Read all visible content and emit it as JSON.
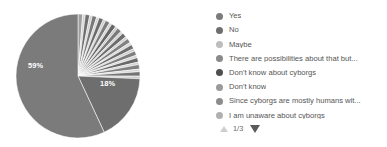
{
  "widget": {
    "type": "pie-chart-with-legend",
    "background": "#ffffff"
  },
  "chart_data": {
    "type": "pie",
    "title": "",
    "legend_position": "right",
    "grid": false,
    "labels_shown_on_slices": [
      "59%",
      "18%"
    ],
    "categories": [
      "Yes",
      "No",
      "Maybe",
      "There are possibilities about that but...",
      "Don't know about cyborgs",
      "Don't know",
      "Since cyborgs are mostly humans wit...",
      "I am unaware about cyborgs"
    ],
    "values": [
      59,
      18,
      3,
      2,
      2,
      2,
      2,
      2
    ],
    "colors": [
      "#7b7b7b",
      "#6e6e6e",
      "#bdbdbd",
      "#858585",
      "#4f4f4f",
      "#9a9a9a",
      "#8c8c8c",
      "#b0b0b0"
    ],
    "slice_labels": [
      {
        "text": "59%",
        "x": 28,
        "y": 68
      },
      {
        "text": "18%",
        "x": 100,
        "y": 86
      }
    ],
    "slices": [
      {
        "start": -90.0,
        "end": -90.0,
        "color": "#dddddd"
      },
      {
        "start": -90.0,
        "end": -85.6,
        "color": "#9e9e9e"
      },
      {
        "start": -85.6,
        "end": -83.2,
        "color": "#d2d2d2"
      },
      {
        "start": -83.2,
        "end": -79.0,
        "color": "#6f6f6f"
      },
      {
        "start": -79.0,
        "end": -76.6,
        "color": "#cfcfcf"
      },
      {
        "start": -76.6,
        "end": -72.4,
        "color": "#787878"
      },
      {
        "start": -72.4,
        "end": -70.0,
        "color": "#d4d4d4"
      },
      {
        "start": -70.0,
        "end": -65.8,
        "color": "#6b6b6b"
      },
      {
        "start": -65.8,
        "end": -63.4,
        "color": "#d0d0d0"
      },
      {
        "start": -63.4,
        "end": -59.2,
        "color": "#7d7d7d"
      },
      {
        "start": -59.2,
        "end": -56.8,
        "color": "#d6d6d6"
      },
      {
        "start": -56.8,
        "end": -52.6,
        "color": "#666666"
      },
      {
        "start": -52.6,
        "end": -50.2,
        "color": "#cdcdcd"
      },
      {
        "start": -50.2,
        "end": -46.0,
        "color": "#7a7a7a"
      },
      {
        "start": -46.0,
        "end": -43.6,
        "color": "#d3d3d3"
      },
      {
        "start": -43.6,
        "end": -39.4,
        "color": "#6d6d6d"
      },
      {
        "start": -39.4,
        "end": -37.0,
        "color": "#d1d1d1"
      },
      {
        "start": -37.0,
        "end": -32.8,
        "color": "#828282"
      },
      {
        "start": -32.8,
        "end": -30.4,
        "color": "#d7d7d7"
      },
      {
        "start": -30.4,
        "end": -26.2,
        "color": "#707070"
      },
      {
        "start": -26.2,
        "end": -23.8,
        "color": "#cecece"
      },
      {
        "start": -23.8,
        "end": -19.6,
        "color": "#7e7e7e"
      },
      {
        "start": -19.6,
        "end": -17.2,
        "color": "#d5d5d5"
      },
      {
        "start": -17.2,
        "end": -13.0,
        "color": "#696969"
      },
      {
        "start": -13.0,
        "end": -10.6,
        "color": "#d2d2d2"
      },
      {
        "start": -10.6,
        "end": -6.4,
        "color": "#808080"
      },
      {
        "start": -6.4,
        "end": -4.0,
        "color": "#d8d8d8"
      },
      {
        "start": -4.0,
        "end": 0.2,
        "color": "#747474"
      },
      {
        "start": 0.2,
        "end": 2.6,
        "color": "#cccccc"
      },
      {
        "start": 2.6,
        "end": 65.0,
        "color": "#6e6e6e"
      },
      {
        "start": 65.0,
        "end": 270.0,
        "color": "#7b7b7b"
      }
    ]
  },
  "legend": {
    "items": [
      {
        "label": "Yes",
        "color": "#7b7b7b"
      },
      {
        "label": "No",
        "color": "#6e6e6e"
      },
      {
        "label": "Maybe",
        "color": "#bdbdbd"
      },
      {
        "label": "There are possibilities about that but...",
        "color": "#8a8a8a"
      },
      {
        "label": "Don't know about cyborgs",
        "color": "#4f4f4f"
      },
      {
        "label": "Don't know",
        "color": "#9a9a9a"
      },
      {
        "label": "Since cyborgs are mostly humans wit...",
        "color": "#8c8c8c"
      },
      {
        "label": "I am unaware about cyborgs",
        "color": "#b0b0b0"
      }
    ]
  },
  "pager": {
    "count_label": "1/3",
    "up_icon": "triangle-up-icon",
    "down_icon": "triangle-down-icon",
    "up_enabled": false,
    "down_enabled": true
  }
}
